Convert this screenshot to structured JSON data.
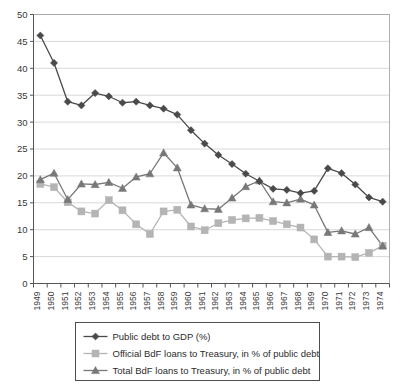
{
  "chart_data": {
    "type": "line",
    "title": "",
    "subtitle": "",
    "xlabel": "",
    "ylabel": "",
    "xlim": [
      1949,
      1974
    ],
    "ylim": [
      0,
      50
    ],
    "ytick_step": 5,
    "grid": true,
    "grid_axis": "y",
    "legend_position": "bottom",
    "categories": [
      "1949",
      "1950",
      "1951",
      "1952",
      "1953",
      "1954",
      "1955",
      "1956",
      "1957",
      "1958",
      "1959",
      "1960",
      "1961",
      "1962",
      "1963",
      "1964",
      "1965",
      "1966",
      "1967",
      "1968",
      "1969",
      "1970",
      "1971",
      "1972",
      "1973",
      "1974"
    ],
    "ytick_labels": [
      "0",
      "5",
      "10",
      "15",
      "20",
      "25",
      "30",
      "35",
      "40",
      "45",
      "50"
    ],
    "ytick_values": [
      0,
      5,
      10,
      15,
      20,
      25,
      30,
      35,
      40,
      45,
      50
    ],
    "series": [
      {
        "name": "Public debt to GDP (%)",
        "marker": "diamond",
        "color": "#4a4a4a",
        "values": [
          46.1,
          41.0,
          33.8,
          33.1,
          35.4,
          34.8,
          33.6,
          33.8,
          33.1,
          32.5,
          31.4,
          28.5,
          26.0,
          23.9,
          22.2,
          20.4,
          19.0,
          17.6,
          17.4,
          16.8,
          17.2,
          21.4,
          20.5,
          18.4,
          16.0,
          15.2
        ]
      },
      {
        "name": "Official BdF loans to Treasury, in % of public debt",
        "marker": "square",
        "color": "#b4b4b4",
        "values": [
          18.5,
          17.9,
          15.1,
          13.4,
          13.0,
          15.5,
          13.6,
          11.0,
          9.2,
          13.4,
          13.7,
          10.6,
          9.9,
          11.2,
          11.8,
          12.1,
          12.2,
          11.6,
          11.0,
          10.4,
          8.2,
          5.0,
          5.0,
          4.9,
          5.7,
          7.0
        ]
      },
      {
        "name": "Total BdF loans to Treasury, in % of public debt",
        "marker": "triangle",
        "color": "#787878",
        "values": [
          19.3,
          20.5,
          15.6,
          18.5,
          18.4,
          18.8,
          17.7,
          19.8,
          20.4,
          24.3,
          21.5,
          14.6,
          13.9,
          13.8,
          15.9,
          18.0,
          19.1,
          15.2,
          15.0,
          15.7,
          14.6,
          9.5,
          9.8,
          9.2,
          10.4,
          7.0
        ]
      }
    ]
  },
  "legend": {
    "entries": [
      {
        "label": "Public debt to GDP (%)",
        "marker": "diamond",
        "color": "#4a4a4a"
      },
      {
        "label": "Official BdF loans to Treasury, in % of public debt",
        "marker": "square",
        "color": "#b4b4b4"
      },
      {
        "label": "Total BdF loans to Treasury, in % of public debt",
        "marker": "triangle",
        "color": "#787878"
      }
    ]
  },
  "colors": {
    "background": "#ffffff",
    "grid": "#c9c9c9",
    "axis": "#555555",
    "frame": "#9a9a9a",
    "text": "#2b2b2b",
    "series_1": "#4a4a4a",
    "series_2": "#b4b4b4",
    "series_3": "#787878"
  }
}
